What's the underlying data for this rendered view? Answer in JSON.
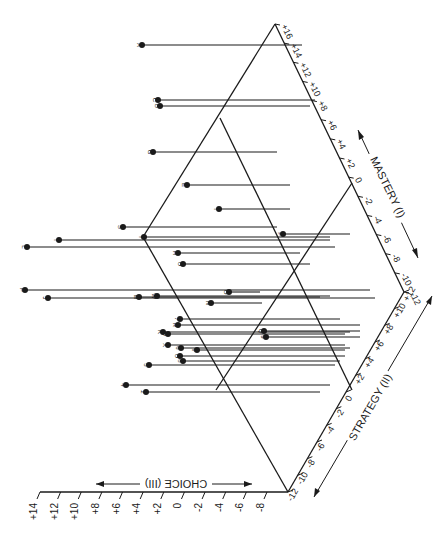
{
  "chart_data": {
    "type": "scatter",
    "subtype": "3d-pin-plot",
    "orientation_note": "figure rendered rotated; stems run horizontally to the right",
    "axes": {
      "choice": {
        "label": "CHOICE (III)",
        "ticks": [
          "+14",
          "+12",
          "+10",
          "+8",
          "+6",
          "+4",
          "+2",
          "0",
          "-2",
          "-4",
          "-6",
          "-8"
        ],
        "range": [
          -12,
          14
        ]
      },
      "strategy": {
        "label": "STRATEGY (II)",
        "ticks": [
          "-12",
          "-10",
          "-8",
          "-6",
          "-4",
          "-2",
          "0",
          "+2",
          "+4",
          "+6",
          "+8",
          "+10",
          "+12"
        ],
        "range": [
          -12,
          12
        ]
      },
      "mastery": {
        "label": "MASTERY (I)",
        "ticks": [
          "-12",
          "-10",
          "-8",
          "-6",
          "-4",
          "-2",
          "0",
          "+2",
          "+4",
          "+6",
          "+8",
          "+10",
          "+12",
          "+14",
          "+16"
        ],
        "range": [
          -12,
          16
        ]
      }
    },
    "points": [
      {
        "label": "A",
        "x": 142,
        "y": 45,
        "stem_end": 302
      },
      {
        "label": "C",
        "x": 158,
        "y": 100,
        "stem_end": 315
      },
      {
        "label": "B",
        "x": 160,
        "y": 106,
        "stem_end": 310
      },
      {
        "label": "G",
        "x": 153,
        "y": 152,
        "stem_end": 277
      },
      {
        "label": "E",
        "x": 187,
        "y": 185,
        "stem_end": 290
      },
      {
        "label": "I",
        "x": 219,
        "y": 209,
        "stem_end": 290
      },
      {
        "label": "F",
        "x": 283,
        "y": 234,
        "stem_end": 350
      },
      {
        "label": "S",
        "x": 123,
        "y": 227,
        "stem_end": 277
      },
      {
        "label": "T",
        "x": 59,
        "y": 240,
        "stem_end": 330
      },
      {
        "label": "Y",
        "x": 144,
        "y": 237,
        "stem_end": 330
      },
      {
        "label": "L",
        "x": 27,
        "y": 247,
        "stem_end": 335
      },
      {
        "label": "H",
        "x": 178,
        "y": 253,
        "stem_end": 300
      },
      {
        "label": "U",
        "x": 183,
        "y": 264,
        "stem_end": 310
      },
      {
        "label": "P",
        "x": 25,
        "y": 290,
        "stem_end": 370
      },
      {
        "label": "J",
        "x": 48,
        "y": 298,
        "stem_end": 375
      },
      {
        "label": "M",
        "x": 139,
        "y": 297,
        "stem_end": 320
      },
      {
        "label": "W",
        "x": 157,
        "y": 296,
        "stem_end": 330
      },
      {
        "label": "O",
        "x": 229,
        "y": 292,
        "stem_end": 260
      },
      {
        "label": "N",
        "x": 211,
        "y": 303,
        "stem_end": 262
      },
      {
        "label": "7",
        "x": 180,
        "y": 319,
        "stem_end": 340
      },
      {
        "label": "R",
        "x": 178,
        "y": 325,
        "stem_end": 360
      },
      {
        "label": "K",
        "x": 163,
        "y": 332,
        "stem_end": 350
      },
      {
        "label": "D",
        "x": 168,
        "y": 334,
        "stem_end": 345
      },
      {
        "label": "Q",
        "x": 264,
        "y": 331,
        "stem_end": 360
      },
      {
        "label": "9",
        "x": 266,
        "y": 337,
        "stem_end": 360
      },
      {
        "label": "X",
        "x": 168,
        "y": 345,
        "stem_end": 345
      },
      {
        "label": "6",
        "x": 181,
        "y": 348,
        "stem_end": 350
      },
      {
        "label": "V",
        "x": 197,
        "y": 350,
        "stem_end": 345
      },
      {
        "label": "U2",
        "x": 180,
        "y": 356,
        "stem_end": 345
      },
      {
        "label": "8",
        "x": 183,
        "y": 361,
        "stem_end": 340
      },
      {
        "label": "5",
        "x": 149,
        "y": 365,
        "stem_end": 335
      },
      {
        "label": "4",
        "x": 126,
        "y": 385,
        "stem_end": 330
      },
      {
        "label": "2",
        "x": 146,
        "y": 392,
        "stem_end": 320
      }
    ]
  },
  "labels": {
    "choice_axis": "CHOICE (III)",
    "strategy_axis": "STRATEGY (II)",
    "mastery_axis": "MASTERY (I)"
  }
}
